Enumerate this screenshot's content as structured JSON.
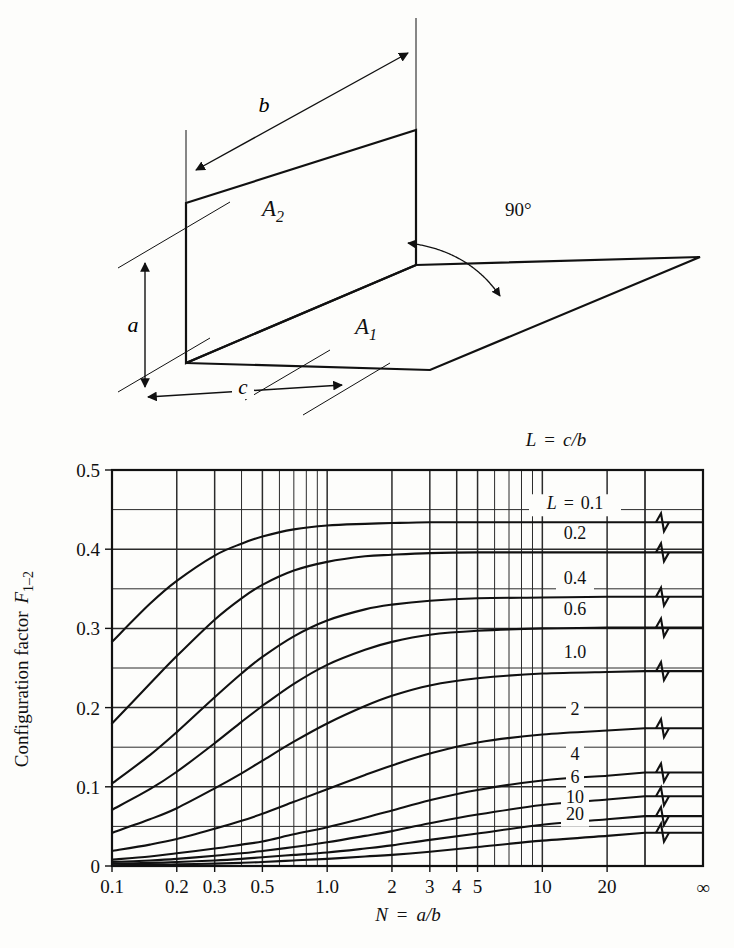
{
  "figure": {
    "kind": "radiation-configuration-factor-chart",
    "diagram": {
      "title_geometry": "two perpendicular rectangles with a common edge",
      "labels": {
        "area_1": "A",
        "area_1_sub": "1",
        "area_2": "A",
        "area_2_sub": "2",
        "dim_a": "a",
        "dim_b": "b",
        "dim_c": "c",
        "angle": "90°"
      }
    },
    "legend": {
      "title_lhs": "L",
      "title_eq": "=",
      "title_rhs": "c/b",
      "curve_prefix_lhs": "L",
      "curve_prefix_eq": "="
    }
  },
  "chart_data": {
    "type": "line",
    "title": "",
    "xlabel_lhs": "N",
    "xlabel_eq": "=",
    "xlabel_rhs": "a/b",
    "ylabel_main": "Configuration factor",
    "ylabel_symbol": "F",
    "ylabel_sub": "1–2",
    "xscale": "log",
    "yscale": "linear",
    "xlim": [
      0.1,
      30
    ],
    "ylim": [
      0,
      0.5
    ],
    "grid": true,
    "legend_position": "inline-right",
    "xticks": [
      0.1,
      0.2,
      0.3,
      0.5,
      1.0,
      2,
      3,
      4,
      5,
      10,
      20
    ],
    "xticklabels": [
      "0.1",
      "0.2",
      "0.3",
      "0.5",
      "1.0",
      "2",
      "3",
      "4",
      "5",
      "10",
      "20"
    ],
    "x_infinity_label": "∞",
    "yticks": [
      0,
      0.1,
      0.2,
      0.3,
      0.4,
      0.5
    ],
    "yticklabels": [
      "0",
      "0.1",
      "0.2",
      "0.3",
      "0.4",
      "0.5"
    ],
    "y_minor_step": 0.05,
    "series": [
      {
        "name": "L = 0.1",
        "label": "0.1",
        "L": 0.1,
        "x": [
          0.1,
          0.15,
          0.2,
          0.3,
          0.4,
          0.5,
          0.7,
          1.0,
          1.5,
          2.0,
          3.0,
          5.0,
          10.0,
          20.0
        ],
        "values": [
          0.283,
          0.331,
          0.36,
          0.392,
          0.407,
          0.416,
          0.425,
          0.43,
          0.432,
          0.433,
          0.434,
          0.434,
          0.434,
          0.434
        ],
        "asymptote": 0.434
      },
      {
        "name": "L = 0.2",
        "label": "0.2",
        "L": 0.2,
        "x": [
          0.1,
          0.15,
          0.2,
          0.3,
          0.4,
          0.5,
          0.7,
          1.0,
          1.5,
          2.0,
          3.0,
          5.0,
          10.0,
          20.0
        ],
        "values": [
          0.18,
          0.23,
          0.265,
          0.311,
          0.338,
          0.355,
          0.373,
          0.384,
          0.391,
          0.393,
          0.395,
          0.396,
          0.396,
          0.396
        ],
        "asymptote": 0.396
      },
      {
        "name": "L = 0.4",
        "label": "0.4",
        "L": 0.4,
        "x": [
          0.1,
          0.15,
          0.2,
          0.3,
          0.4,
          0.5,
          0.7,
          1.0,
          1.5,
          2.0,
          3.0,
          5.0,
          10.0,
          20.0
        ],
        "values": [
          0.104,
          0.14,
          0.169,
          0.213,
          0.243,
          0.264,
          0.29,
          0.31,
          0.324,
          0.33,
          0.335,
          0.338,
          0.339,
          0.34
        ],
        "asymptote": 0.34
      },
      {
        "name": "L = 0.6",
        "label": "0.6",
        "L": 0.6,
        "x": [
          0.1,
          0.15,
          0.2,
          0.3,
          0.4,
          0.5,
          0.7,
          1.0,
          1.5,
          2.0,
          3.0,
          5.0,
          10.0,
          20.0
        ],
        "values": [
          0.071,
          0.097,
          0.119,
          0.155,
          0.182,
          0.202,
          0.23,
          0.254,
          0.273,
          0.283,
          0.292,
          0.297,
          0.3,
          0.301
        ],
        "asymptote": 0.301
      },
      {
        "name": "L = 1.0",
        "label": "1.0",
        "L": 1.0,
        "x": [
          0.1,
          0.15,
          0.2,
          0.3,
          0.4,
          0.5,
          0.7,
          1.0,
          1.5,
          2.0,
          3.0,
          5.0,
          10.0,
          20.0
        ],
        "values": [
          0.042,
          0.059,
          0.073,
          0.098,
          0.117,
          0.133,
          0.157,
          0.18,
          0.202,
          0.215,
          0.228,
          0.237,
          0.243,
          0.245
        ],
        "asymptote": 0.246
      },
      {
        "name": "L = 2",
        "label": "2",
        "L": 2.0,
        "x": [
          0.1,
          0.15,
          0.2,
          0.3,
          0.4,
          0.5,
          0.7,
          1.0,
          1.5,
          2.0,
          3.0,
          5.0,
          10.0,
          20.0
        ],
        "values": [
          0.019,
          0.027,
          0.034,
          0.047,
          0.057,
          0.066,
          0.081,
          0.097,
          0.115,
          0.127,
          0.142,
          0.156,
          0.166,
          0.171
        ],
        "asymptote": 0.174
      },
      {
        "name": "L = 4",
        "label": "4",
        "L": 4.0,
        "x": [
          0.1,
          0.15,
          0.2,
          0.3,
          0.4,
          0.5,
          0.7,
          1.0,
          1.5,
          2.0,
          3.0,
          5.0,
          10.0,
          20.0
        ],
        "values": [
          0.008,
          0.012,
          0.016,
          0.022,
          0.027,
          0.031,
          0.04,
          0.049,
          0.061,
          0.07,
          0.083,
          0.096,
          0.108,
          0.114
        ],
        "asymptote": 0.118
      },
      {
        "name": "L = 6",
        "label": "6",
        "L": 6.0,
        "x": [
          0.1,
          0.15,
          0.2,
          0.3,
          0.4,
          0.5,
          0.7,
          1.0,
          1.5,
          2.0,
          3.0,
          5.0,
          10.0,
          20.0
        ],
        "values": [
          0.005,
          0.007,
          0.009,
          0.013,
          0.016,
          0.019,
          0.024,
          0.03,
          0.038,
          0.044,
          0.054,
          0.065,
          0.077,
          0.084
        ],
        "asymptote": 0.088
      },
      {
        "name": "L = 10",
        "label": "10",
        "L": 10.0,
        "x": [
          0.1,
          0.15,
          0.2,
          0.3,
          0.4,
          0.5,
          0.7,
          1.0,
          1.5,
          2.0,
          3.0,
          5.0,
          10.0,
          20.0
        ],
        "values": [
          0.003,
          0.004,
          0.005,
          0.007,
          0.009,
          0.011,
          0.014,
          0.017,
          0.022,
          0.026,
          0.033,
          0.041,
          0.052,
          0.059
        ],
        "asymptote": 0.063
      },
      {
        "name": "L = 20",
        "label": "20",
        "L": 20.0,
        "x": [
          0.1,
          0.15,
          0.2,
          0.3,
          0.4,
          0.5,
          0.7,
          1.0,
          1.5,
          2.0,
          3.0,
          5.0,
          10.0,
          20.0
        ],
        "values": [
          0.001,
          0.002,
          0.002,
          0.003,
          0.004,
          0.005,
          0.007,
          0.009,
          0.012,
          0.014,
          0.018,
          0.024,
          0.032,
          0.038
        ],
        "asymptote": 0.042
      }
    ]
  },
  "colors": {
    "background": "#fdfdfb",
    "ink": "#111111",
    "grid": "#2b2b2b"
  }
}
